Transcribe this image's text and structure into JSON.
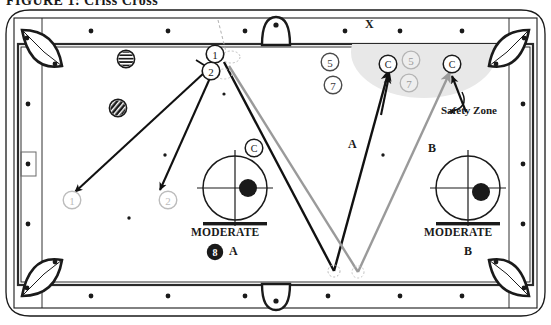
{
  "figure": {
    "title": "FIGURE 1:   Criss Cross",
    "kind": "billiards-table-diagram"
  },
  "table": {
    "rail_marker_icon": "diamond-dot",
    "pockets": [
      "corner-top-left",
      "corner-top-right",
      "corner-bottom-left",
      "corner-bottom-right",
      "side-top",
      "side-bottom"
    ],
    "top_rail_marker_label": "X",
    "left_rail_highlight": "boxed-diamond"
  },
  "safety_zone": {
    "label": "Safety Zone",
    "fill_color": "#e8e8e8"
  },
  "shots": [
    {
      "id": "A",
      "label": "A",
      "power": "MODERATE",
      "ball_label": "8",
      "line_color": "#111111"
    },
    {
      "id": "B",
      "label": "B",
      "power": "MODERATE",
      "line_color": "#9a9a9a"
    }
  ],
  "compass_left": {
    "power_label": "MODERATE",
    "shot_label": "A",
    "ball_label": "8"
  },
  "compass_right": {
    "power_label": "MODERATE",
    "shot_label": "B"
  },
  "balls": [
    {
      "name": "cue-ball-start-1",
      "label": "1",
      "style": "outline"
    },
    {
      "name": "cue-ball-start-2",
      "label": "2",
      "style": "outline"
    },
    {
      "name": "target-ball-1",
      "label": "1",
      "style": "faded"
    },
    {
      "name": "target-ball-2",
      "label": "2",
      "style": "faded"
    },
    {
      "name": "object-ball-5-left",
      "label": "5",
      "style": "outline"
    },
    {
      "name": "object-ball-7-left",
      "label": "7",
      "style": "outline"
    },
    {
      "name": "object-ball-5-zone",
      "label": "5",
      "style": "faded"
    },
    {
      "name": "object-ball-7-zone",
      "label": "7",
      "style": "faded"
    },
    {
      "name": "cue-ball-zone-a",
      "label": "C",
      "style": "outline"
    },
    {
      "name": "cue-ball-zone-b",
      "label": "C",
      "style": "outline"
    },
    {
      "name": "cue-ball-mid",
      "label": "C",
      "style": "outline"
    },
    {
      "name": "striped-ball",
      "label": "",
      "style": "striped"
    },
    {
      "name": "solid-ball",
      "label": "",
      "style": "solid-diag"
    }
  ],
  "colors": {
    "cloth": "#ffffff",
    "rail": "#ffffff",
    "outline": "#1a1a1a",
    "shot_a": "#111111",
    "shot_b": "#9a9a9a",
    "faded": "#b9b9b9",
    "zone": "#e8e8e8"
  }
}
